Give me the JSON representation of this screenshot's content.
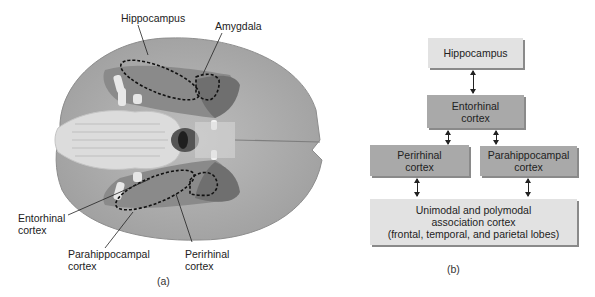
{
  "panel_a": {
    "caption": "(a)",
    "labels": {
      "hippocampus": "Hippocampus",
      "amygdala": "Amygdala",
      "entorhinal_line1": "Entorhinal",
      "entorhinal_line2": "cortex",
      "parahippocampal_line1": "Parahippocampal",
      "parahippocampal_line2": "cortex",
      "perirhinal_line1": "Perirhinal",
      "perirhinal_line2": "cortex"
    }
  },
  "panel_b": {
    "caption": "(b)",
    "nodes": {
      "hippocampus": "Hippocampus",
      "entorhinal_line1": "Entorhinal",
      "entorhinal_line2": "cortex",
      "perirhinal_line1": "Perirhinal",
      "perirhinal_line2": "cortex",
      "parahippocampal_line1": "Parahippocampal",
      "parahippocampal_line2": "cortex",
      "association_line1": "Unimodal and polymodal",
      "association_line2": "association cortex",
      "association_line3": "(frontal, temporal, and parietal lobes)"
    },
    "edges": [
      {
        "from": "Hippocampus",
        "to": "Entorhinal cortex",
        "direction": "bidirectional"
      },
      {
        "from": "Entorhinal cortex",
        "to": "Perirhinal cortex",
        "direction": "bidirectional"
      },
      {
        "from": "Entorhinal cortex",
        "to": "Parahippocampal cortex",
        "direction": "bidirectional"
      },
      {
        "from": "Perirhinal cortex",
        "to": "Unimodal and polymodal association cortex",
        "direction": "bidirectional"
      },
      {
        "from": "Parahippocampal cortex",
        "to": "Unimodal and polymodal association cortex",
        "direction": "bidirectional"
      }
    ],
    "colors": {
      "light_box": "#e2e2e2",
      "dark_box": "#a9a9a9"
    }
  }
}
